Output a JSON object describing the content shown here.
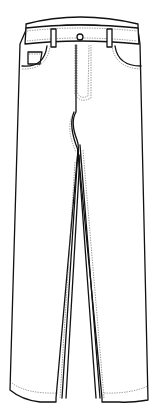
{
  "figure": {
    "view": "front",
    "colors": {
      "line": "#111111",
      "stitch": "#555555",
      "fill": "#ffffff",
      "background": "#ffffff"
    },
    "parts": [
      "waistband",
      "belt-loops",
      "button",
      "fly",
      "front-pockets",
      "coin-pocket",
      "left-leg",
      "right-leg",
      "hems"
    ]
  }
}
